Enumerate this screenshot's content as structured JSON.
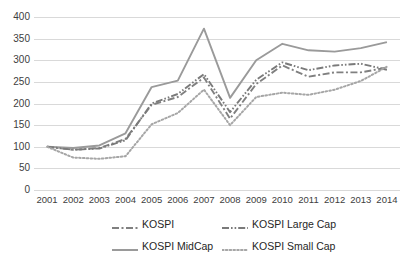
{
  "chart_data": {
    "type": "line",
    "title": "",
    "xlabel": "",
    "ylabel": "",
    "ylim": [
      0,
      400
    ],
    "yticks": [
      0,
      50,
      100,
      150,
      200,
      250,
      300,
      350,
      400
    ],
    "grid": true,
    "legend_position": "bottom",
    "categories": [
      "2001",
      "2002",
      "2003",
      "2004",
      "2005",
      "2006",
      "2007",
      "2008",
      "2009",
      "2010",
      "2011",
      "2012",
      "2013",
      "2014"
    ],
    "series": [
      {
        "name": "KOSPI",
        "style": "dash-dot",
        "color": "#808080",
        "values": [
          100,
          93,
          97,
          118,
          197,
          215,
          260,
          165,
          245,
          288,
          262,
          272,
          272,
          283
        ]
      },
      {
        "name": "KOSPI MidCap",
        "style": "solid",
        "color": "#9a9a9a",
        "values": [
          100,
          97,
          103,
          131,
          238,
          253,
          373,
          213,
          300,
          338,
          323,
          320,
          328,
          342
        ]
      },
      {
        "name": "KOSPI Large Cap",
        "style": "dash-dot-dot",
        "color": "#7a7a7a",
        "values": [
          100,
          93,
          96,
          115,
          200,
          222,
          268,
          180,
          255,
          295,
          277,
          288,
          292,
          278
        ]
      },
      {
        "name": "KOSPI Small Cap",
        "style": "dotted",
        "color": "#a6a6a6",
        "values": [
          100,
          75,
          72,
          78,
          152,
          178,
          232,
          150,
          215,
          225,
          220,
          232,
          252,
          285
        ]
      }
    ]
  },
  "legend": {
    "items": [
      {
        "label": "KOSPI"
      },
      {
        "label": "KOSPI Large Cap"
      },
      {
        "label": "KOSPI MidCap"
      },
      {
        "label": "KOSPI Small Cap"
      }
    ]
  }
}
